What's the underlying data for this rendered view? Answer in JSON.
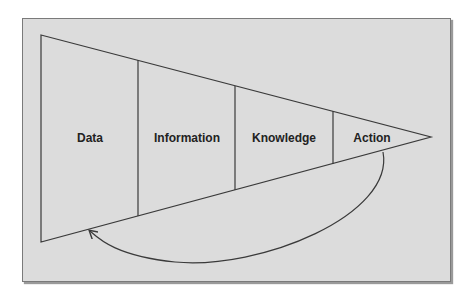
{
  "diagram": {
    "type": "funnel-feedback",
    "stages": [
      {
        "label": "Data",
        "x": 90
      },
      {
        "label": "Information",
        "x": 187
      },
      {
        "label": "Knowledge",
        "x": 284
      },
      {
        "label": "Action",
        "x": 372
      }
    ],
    "feedback_arrow": {
      "from": "Action",
      "to": "Data"
    },
    "colors": {
      "background": "#dcdcdc",
      "line": "#3a3a3a",
      "text": "#222222"
    }
  }
}
